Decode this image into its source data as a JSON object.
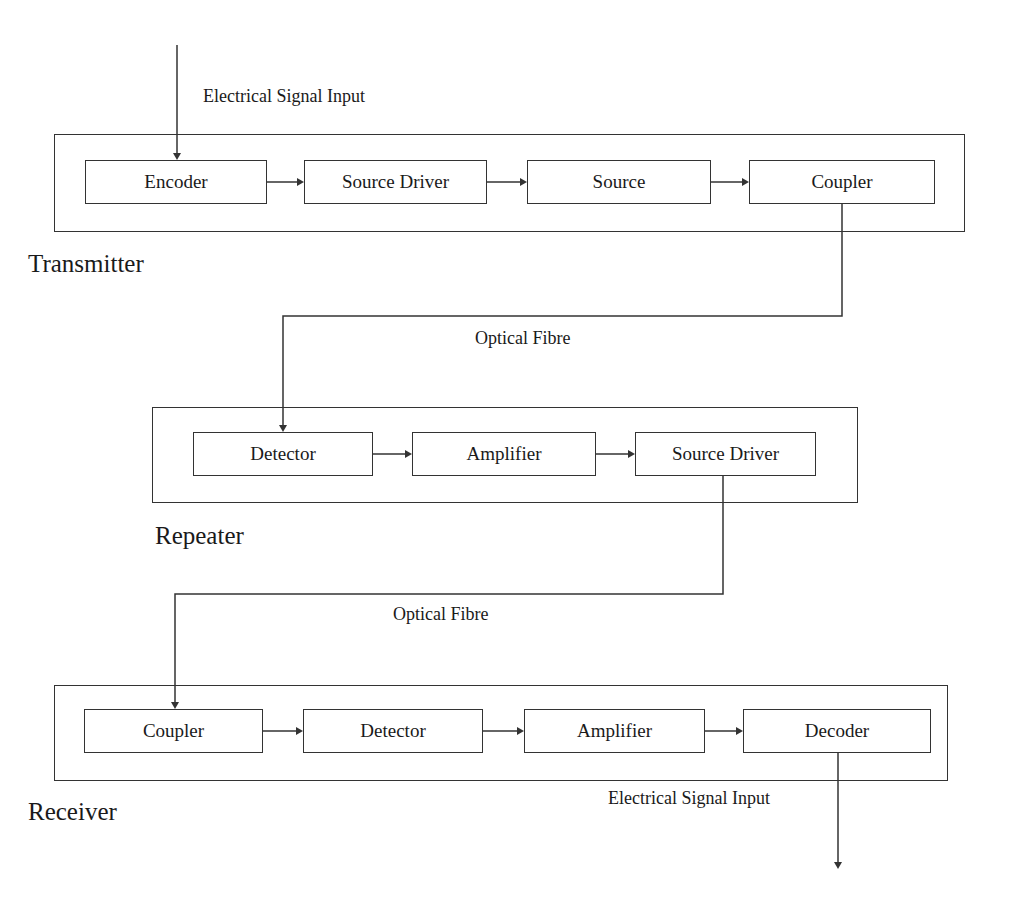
{
  "diagram": {
    "stages": [
      {
        "name": "Transmitter",
        "label": "Transmitter",
        "blocks": [
          "Encoder",
          "Source Driver",
          "Source",
          "Coupler"
        ]
      },
      {
        "name": "Repeater",
        "label": "Repeater",
        "blocks": [
          "Detector",
          "Amplifier",
          "Source Driver"
        ]
      },
      {
        "name": "Receiver",
        "label": "Receiver",
        "blocks": [
          "Coupler",
          "Detector",
          "Amplifier",
          "Decoder"
        ]
      }
    ],
    "links": {
      "input_label": "Electrical Signal Input",
      "fibre1_label": "Optical Fibre",
      "fibre2_label": "Optical Fibre",
      "output_label": "Electrical Signal Input"
    },
    "colors": {
      "line": "#333333",
      "text": "#1a1a1a",
      "background": "#ffffff"
    }
  }
}
